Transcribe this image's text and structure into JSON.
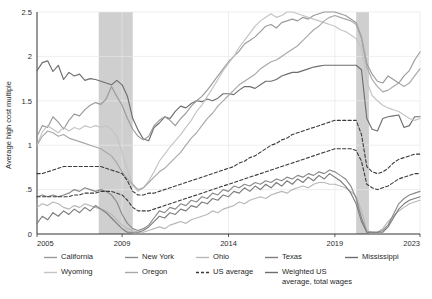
{
  "chart_data": {
    "type": "line",
    "title": "",
    "xlabel": "",
    "ylabel": "Average high cost multiple",
    "xlim": [
      2005,
      2023
    ],
    "ylim": [
      0,
      2.5
    ],
    "xticks": [
      2005,
      2009,
      2014,
      2019,
      2023
    ],
    "xtick_labels": [
      "2005",
      "2009",
      "2014",
      "2019",
      "2023"
    ],
    "yticks": [
      0,
      0.5,
      1,
      1.5,
      2,
      2.5
    ],
    "ytick_labels": [
      "0",
      ".5",
      "1",
      "1.5",
      "2",
      "2.5"
    ],
    "grid": true,
    "legend_position": "below",
    "shaded_regions": [
      {
        "label": "recession",
        "x0": 2007.9,
        "x1": 2009.5,
        "color": "#cfcfcf"
      },
      {
        "label": "recession",
        "x0": 2020.0,
        "x1": 2020.6,
        "color": "#cfcfcf"
      }
    ],
    "x": [
      2005,
      2005.25,
      2005.5,
      2005.75,
      2006,
      2006.25,
      2006.5,
      2006.75,
      2007,
      2007.25,
      2007.5,
      2007.75,
      2008,
      2008.25,
      2008.5,
      2008.75,
      2009,
      2009.25,
      2009.5,
      2009.75,
      2010,
      2010.25,
      2010.5,
      2010.75,
      2011,
      2011.25,
      2011.5,
      2011.75,
      2012,
      2012.25,
      2012.5,
      2012.75,
      2013,
      2013.25,
      2013.5,
      2013.75,
      2014,
      2014.25,
      2014.5,
      2014.75,
      2015,
      2015.25,
      2015.5,
      2015.75,
      2016,
      2016.25,
      2016.5,
      2016.75,
      2017,
      2017.25,
      2017.5,
      2017.75,
      2018,
      2018.25,
      2018.5,
      2018.75,
      2019,
      2019.25,
      2019.5,
      2019.75,
      2020,
      2020.25,
      2020.5,
      2020.75,
      2021,
      2021.25,
      2021.5,
      2021.75,
      2022,
      2022.25,
      2022.5,
      2022.75,
      2023
    ],
    "series": [
      {
        "name": "Mississippi",
        "color": "#6e6e6e",
        "style": "solid",
        "values": [
          1.84,
          1.93,
          1.95,
          1.83,
          1.9,
          1.74,
          1.82,
          1.78,
          1.8,
          1.73,
          1.75,
          1.74,
          1.72,
          1.7,
          1.68,
          1.73,
          1.68,
          1.55,
          1.3,
          1.17,
          1.07,
          1.05,
          1.2,
          1.25,
          1.32,
          1.3,
          1.38,
          1.44,
          1.42,
          1.47,
          1.5,
          1.49,
          1.52,
          1.5,
          1.53,
          1.58,
          1.58,
          1.57,
          1.62,
          1.66,
          1.66,
          1.64,
          1.68,
          1.72,
          1.72,
          1.74,
          1.78,
          1.8,
          1.82,
          1.82,
          1.84,
          1.86,
          1.88,
          1.89,
          1.9,
          1.9,
          1.9,
          1.9,
          1.9,
          1.9,
          1.9,
          1.85,
          1.3,
          1.18,
          1.16,
          1.3,
          1.32,
          1.33,
          1.34,
          1.2,
          1.22,
          1.32,
          1.32
        ]
      },
      {
        "name": "California",
        "color": "#9a9a9a",
        "style": "solid",
        "values": [
          1.1,
          1.22,
          1.2,
          1.32,
          1.26,
          1.18,
          1.28,
          1.35,
          1.33,
          1.4,
          1.45,
          1.48,
          1.46,
          1.52,
          1.66,
          1.55,
          1.45,
          1.3,
          1.18,
          1.1,
          1.06,
          1.1,
          1.22,
          1.28,
          1.32,
          1.28,
          1.22,
          1.3,
          1.36,
          1.44,
          1.5,
          1.55,
          1.62,
          1.7,
          1.78,
          1.86,
          1.94,
          2.0,
          2.06,
          2.14,
          2.18,
          2.22,
          2.28,
          2.34,
          2.36,
          2.32,
          2.38,
          2.4,
          2.42,
          2.4,
          2.44,
          2.42,
          2.46,
          2.48,
          2.5,
          2.5,
          2.5,
          2.48,
          2.46,
          2.42,
          2.38,
          2.22,
          1.92,
          1.8,
          1.72,
          1.7,
          1.78,
          1.74,
          1.7,
          1.78,
          1.84,
          1.96,
          2.05
        ]
      },
      {
        "name": "Wyoming",
        "color": "#c4c4c4",
        "style": "solid",
        "values": [
          1.0,
          1.15,
          1.22,
          1.18,
          1.14,
          1.2,
          1.16,
          1.2,
          1.18,
          1.22,
          1.2,
          1.22,
          1.2,
          1.22,
          1.18,
          1.1,
          0.92,
          0.72,
          0.55,
          0.48,
          0.52,
          0.6,
          0.7,
          0.82,
          0.9,
          0.98,
          1.05,
          1.12,
          1.2,
          1.28,
          1.38,
          1.45,
          1.55,
          1.64,
          1.74,
          1.84,
          1.92,
          2.0,
          2.1,
          2.18,
          2.26,
          2.34,
          2.4,
          2.44,
          2.48,
          2.44,
          2.46,
          2.5,
          2.5,
          2.48,
          2.46,
          2.44,
          2.42,
          2.4,
          2.38,
          2.36,
          2.34,
          2.3,
          2.28,
          2.24,
          2.2,
          2.1,
          1.72,
          1.56,
          1.5,
          1.45,
          1.42,
          1.4,
          1.38,
          1.34,
          1.3,
          1.28,
          1.3
        ]
      },
      {
        "name": "Oregon",
        "color": "#a8a8a8",
        "style": "solid",
        "values": [
          1.0,
          1.1,
          1.16,
          1.14,
          1.1,
          1.12,
          1.08,
          1.06,
          1.04,
          1.02,
          1.0,
          0.98,
          0.96,
          0.92,
          0.88,
          0.8,
          0.7,
          0.62,
          0.56,
          0.5,
          0.52,
          0.58,
          0.64,
          0.7,
          0.74,
          0.8,
          0.86,
          0.92,
          1.0,
          1.08,
          1.14,
          1.22,
          1.3,
          1.36,
          1.44,
          1.5,
          1.56,
          1.62,
          1.68,
          1.72,
          1.76,
          1.8,
          1.86,
          1.9,
          1.94,
          1.96,
          2.0,
          2.04,
          2.08,
          2.12,
          2.18,
          2.24,
          2.3,
          2.34,
          2.4,
          2.44,
          2.46,
          2.44,
          2.42,
          2.4,
          2.36,
          2.2,
          1.88,
          1.74,
          1.66,
          1.6,
          1.62,
          1.66,
          1.7,
          1.66,
          1.7,
          1.78,
          1.86
        ]
      },
      {
        "name": "Ohio",
        "color": "#b8b8b8",
        "style": "solid",
        "values": [
          0.3,
          0.34,
          0.32,
          0.36,
          0.34,
          0.3,
          0.28,
          0.32,
          0.3,
          0.34,
          0.32,
          0.3,
          0.28,
          0.26,
          0.22,
          0.16,
          0.1,
          0.06,
          0.04,
          0.02,
          0.02,
          0.04,
          0.06,
          0.08,
          0.06,
          0.1,
          0.12,
          0.14,
          0.12,
          0.16,
          0.18,
          0.2,
          0.22,
          0.26,
          0.24,
          0.28,
          0.3,
          0.32,
          0.36,
          0.34,
          0.38,
          0.4,
          0.42,
          0.4,
          0.44,
          0.46,
          0.48,
          0.46,
          0.5,
          0.52,
          0.54,
          0.52,
          0.56,
          0.58,
          0.58,
          0.56,
          0.56,
          0.54,
          0.52,
          0.48,
          0.42,
          0.26,
          0.04,
          0.02,
          0.02,
          0.06,
          0.14,
          0.2,
          0.26,
          0.3,
          0.34,
          0.36,
          0.38
        ]
      },
      {
        "name": "New York",
        "color": "#8a8a8a",
        "style": "solid",
        "values": [
          0.42,
          0.44,
          0.42,
          0.44,
          0.42,
          0.44,
          0.46,
          0.5,
          0.48,
          0.52,
          0.5,
          0.48,
          0.5,
          0.48,
          0.44,
          0.36,
          0.22,
          0.12,
          0.06,
          0.04,
          0.06,
          0.1,
          0.18,
          0.26,
          0.24,
          0.3,
          0.28,
          0.34,
          0.32,
          0.38,
          0.36,
          0.42,
          0.4,
          0.46,
          0.44,
          0.5,
          0.48,
          0.54,
          0.52,
          0.56,
          0.54,
          0.58,
          0.56,
          0.6,
          0.58,
          0.62,
          0.6,
          0.64,
          0.62,
          0.66,
          0.64,
          0.68,
          0.66,
          0.7,
          0.68,
          0.72,
          0.7,
          0.66,
          0.62,
          0.54,
          0.4,
          0.18,
          0.02,
          0.02,
          0.02,
          0.04,
          0.1,
          0.22,
          0.34,
          0.4,
          0.44,
          0.46,
          0.48
        ]
      },
      {
        "name": "Texas",
        "color": "#7d7d7d",
        "style": "solid",
        "values": [
          0.12,
          0.2,
          0.16,
          0.24,
          0.2,
          0.26,
          0.22,
          0.28,
          0.24,
          0.3,
          0.26,
          0.32,
          0.28,
          0.24,
          0.18,
          0.12,
          0.06,
          0.02,
          0.02,
          0.02,
          0.04,
          0.08,
          0.14,
          0.2,
          0.18,
          0.24,
          0.22,
          0.28,
          0.26,
          0.32,
          0.3,
          0.36,
          0.34,
          0.4,
          0.38,
          0.44,
          0.42,
          0.48,
          0.46,
          0.52,
          0.48,
          0.54,
          0.5,
          0.56,
          0.52,
          0.58,
          0.54,
          0.6,
          0.56,
          0.62,
          0.58,
          0.64,
          0.6,
          0.66,
          0.62,
          0.68,
          0.64,
          0.6,
          0.54,
          0.46,
          0.34,
          0.14,
          0.02,
          0.02,
          0.02,
          0.02,
          0.08,
          0.18,
          0.28,
          0.34,
          0.38,
          0.4,
          0.42
        ]
      },
      {
        "name": "US average",
        "color": "#3a3a3a",
        "style": "dashed",
        "values": [
          0.68,
          0.68,
          0.7,
          0.72,
          0.74,
          0.76,
          0.76,
          0.76,
          0.76,
          0.76,
          0.76,
          0.76,
          0.76,
          0.74,
          0.72,
          0.7,
          0.68,
          0.6,
          0.48,
          0.44,
          0.44,
          0.46,
          0.46,
          0.48,
          0.5,
          0.52,
          0.54,
          0.56,
          0.58,
          0.6,
          0.62,
          0.64,
          0.66,
          0.68,
          0.7,
          0.72,
          0.74,
          0.76,
          0.8,
          0.82,
          0.86,
          0.88,
          0.92,
          0.96,
          1.0,
          1.02,
          1.06,
          1.08,
          1.12,
          1.14,
          1.16,
          1.18,
          1.2,
          1.22,
          1.24,
          1.26,
          1.28,
          1.28,
          1.28,
          1.28,
          1.28,
          1.12,
          0.76,
          0.7,
          0.68,
          0.7,
          0.74,
          0.8,
          0.84,
          0.86,
          0.88,
          0.9,
          0.9
        ]
      },
      {
        "name": "Weighted US average, total wages",
        "color": "#3a3a3a",
        "style": "dashed",
        "values": [
          0.42,
          0.42,
          0.42,
          0.42,
          0.42,
          0.42,
          0.42,
          0.44,
          0.44,
          0.46,
          0.46,
          0.46,
          0.48,
          0.48,
          0.48,
          0.46,
          0.44,
          0.38,
          0.3,
          0.26,
          0.26,
          0.26,
          0.28,
          0.3,
          0.32,
          0.34,
          0.36,
          0.38,
          0.4,
          0.42,
          0.44,
          0.46,
          0.48,
          0.5,
          0.52,
          0.54,
          0.56,
          0.58,
          0.6,
          0.62,
          0.64,
          0.66,
          0.68,
          0.7,
          0.72,
          0.74,
          0.76,
          0.78,
          0.8,
          0.82,
          0.84,
          0.86,
          0.88,
          0.9,
          0.92,
          0.94,
          0.96,
          0.96,
          0.96,
          0.96,
          0.94,
          0.82,
          0.56,
          0.52,
          0.5,
          0.52,
          0.54,
          0.58,
          0.62,
          0.64,
          0.66,
          0.68,
          0.68
        ]
      }
    ]
  },
  "legend": {
    "columns": [
      {
        "items": [
          {
            "label": "California",
            "color": "#9a9a9a",
            "style": "solid",
            "multiline": false
          },
          {
            "label": "Wyoming",
            "color": "#c4c4c4",
            "style": "solid",
            "multiline": false
          }
        ]
      },
      {
        "items": [
          {
            "label": "New York",
            "color": "#8a8a8a",
            "style": "solid",
            "multiline": false
          },
          {
            "label": "Oregon",
            "color": "#a8a8a8",
            "style": "solid",
            "multiline": false
          }
        ]
      },
      {
        "items": [
          {
            "label": "Ohio",
            "color": "#b8b8b8",
            "style": "solid",
            "multiline": false
          },
          {
            "label": "US average",
            "color": "#3a3a3a",
            "style": "dashed",
            "multiline": false
          }
        ]
      },
      {
        "items": [
          {
            "label": "Texas",
            "color": "#7d7d7d",
            "style": "solid",
            "multiline": false
          },
          {
            "label": "Weighted US average, total wages",
            "color": "#6e6e6e",
            "style": "solid",
            "multiline": true
          }
        ]
      },
      {
        "items": [
          {
            "label": "Mississippi",
            "color": "#6e6e6e",
            "style": "solid",
            "multiline": false
          }
        ]
      }
    ]
  }
}
